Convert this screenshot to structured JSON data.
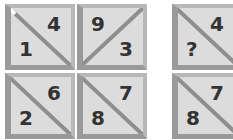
{
  "puzzle": {
    "left_grid": [
      {
        "diagonal": "tl-br",
        "top": "4",
        "bottom": "1"
      },
      {
        "diagonal": "tr-bl",
        "top": "9",
        "bottom": "3"
      },
      {
        "diagonal": "tl-br",
        "top": "6",
        "bottom": "2"
      },
      {
        "diagonal": "tl-br",
        "top": "7",
        "bottom": "8"
      }
    ],
    "right_column": [
      {
        "diagonal": "tl-br",
        "top": "4",
        "bottom": "?"
      },
      {
        "diagonal": "tl-br",
        "top": "7",
        "bottom": "8"
      }
    ]
  },
  "colors": {
    "tile_fill": "#dcdcdc",
    "border_dark": "#9a9a9a",
    "border_light": "#b8b8b8",
    "text": "#333333"
  }
}
